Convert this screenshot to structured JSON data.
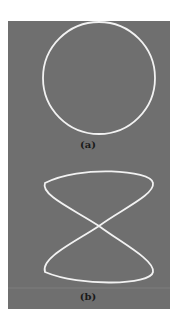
{
  "figure": {
    "background_color": "#6f6f6f",
    "curve_color": "#f2f2f2",
    "panels": [
      {
        "id": "a",
        "label": "(a)",
        "shape": "circle"
      },
      {
        "id": "b",
        "label": "(b)",
        "shape": "figure-eight (Lissajous 1:2)"
      }
    ]
  }
}
